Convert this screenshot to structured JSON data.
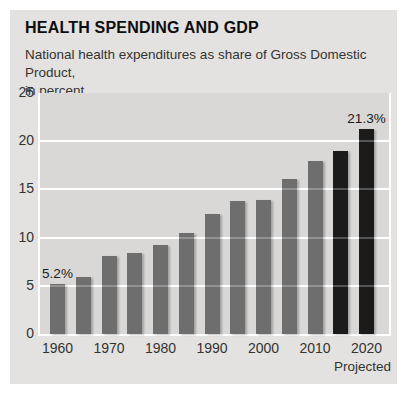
{
  "header": {
    "title": "HEALTH SPENDING AND GDP",
    "subtitle_line1": "National health expenditures as share of Gross Domestic Product,",
    "subtitle_line2": "in percent"
  },
  "chart_data": {
    "type": "bar",
    "categories": [
      "1960",
      "1965",
      "1970",
      "1975",
      "1980",
      "1985",
      "1990",
      "1995",
      "2000",
      "2005",
      "2010",
      "2015",
      "2020"
    ],
    "values": [
      5.2,
      5.9,
      8.1,
      8.4,
      9.2,
      10.5,
      12.4,
      13.8,
      13.9,
      16.1,
      17.9,
      19.0,
      21.3
    ],
    "projected_categories": [
      "2015",
      "2020"
    ],
    "x_tick_labels": [
      "1960",
      "1970",
      "1980",
      "1990",
      "2000",
      "2010",
      "2020"
    ],
    "y_ticks": [
      0,
      5,
      10,
      15,
      20,
      25
    ],
    "ylim": [
      0,
      25
    ],
    "grid": true,
    "legend": "none",
    "x_axis_note": "Projected",
    "annotations": [
      {
        "text": "5.2%",
        "bar_index": 0
      },
      {
        "text": "21.3%",
        "bar_index": 12
      }
    ],
    "colors": {
      "bar": "#6e6e6e",
      "projected_bar": "#1b1b1b",
      "plot_background": "#d9d8d6",
      "card_background": "#e3e2e0",
      "gridline": "#ffffff",
      "text": "#333330"
    }
  }
}
